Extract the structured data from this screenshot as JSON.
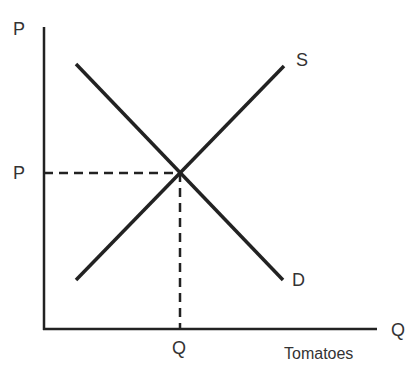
{
  "diagram": {
    "y_axis_label": "P",
    "x_axis_label": "Q",
    "x_axis_caption": "Tomatoes",
    "supply_label": "S",
    "demand_label": "D",
    "equilibrium_price_label": "P",
    "equilibrium_quantity_label": "Q"
  }
}
